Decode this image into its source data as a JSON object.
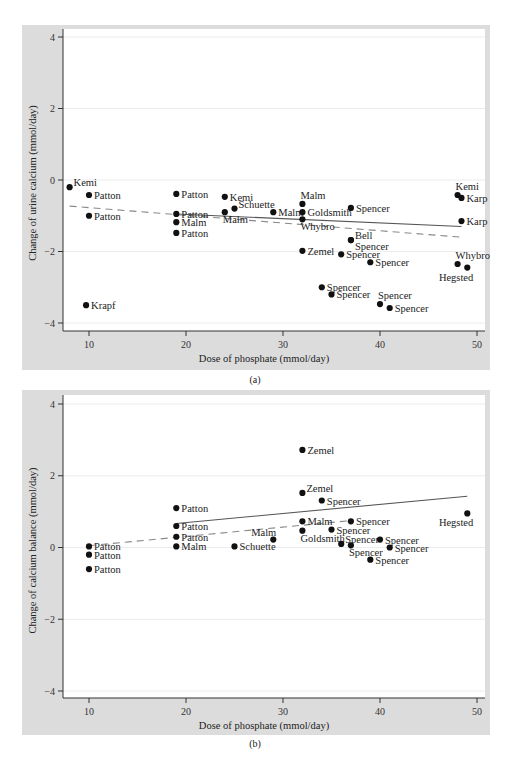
{
  "chart_data": [
    {
      "id": "a",
      "type": "scatter",
      "caption": "(a)",
      "title": "",
      "xlabel": "Dose of phosphate (mmol/day)",
      "ylabel": "Change of urine calcium (mmol/day)",
      "xlim": [
        7.5,
        50.8
      ],
      "ylim": [
        -4.3,
        4.3
      ],
      "xticks": [
        10,
        20,
        30,
        40,
        50
      ],
      "yticks": [
        -4,
        -2,
        0,
        2,
        4
      ],
      "grid": true,
      "points": [
        {
          "x": 8,
          "y": -0.2,
          "label": "Kemi",
          "pos": "right-up"
        },
        {
          "x": 10,
          "y": -0.42,
          "label": "Patton",
          "pos": "right"
        },
        {
          "x": 10,
          "y": -1.0,
          "label": "Patton",
          "pos": "right"
        },
        {
          "x": 9.7,
          "y": -3.5,
          "label": "Krapf",
          "pos": "right"
        },
        {
          "x": 19,
          "y": -0.39,
          "label": "Patton",
          "pos": "right"
        },
        {
          "x": 19,
          "y": -0.95,
          "label": "Patton",
          "pos": "right"
        },
        {
          "x": 19,
          "y": -1.18,
          "label": "Malm",
          "pos": "right"
        },
        {
          "x": 19,
          "y": -1.48,
          "label": "Patton",
          "pos": "right"
        },
        {
          "x": 24,
          "y": -0.47,
          "label": "Kemi",
          "pos": "right"
        },
        {
          "x": 24,
          "y": -0.9,
          "label": "Malm",
          "pos": "below"
        },
        {
          "x": 25,
          "y": -0.8,
          "label": "Schuette",
          "pos": "right-up"
        },
        {
          "x": 29,
          "y": -0.9,
          "label": "Malm",
          "pos": "right"
        },
        {
          "x": 32,
          "y": -0.67,
          "label": "Malm",
          "pos": "above"
        },
        {
          "x": 32,
          "y": -0.9,
          "label": "Goldsmith",
          "pos": "right"
        },
        {
          "x": 32,
          "y": -1.1,
          "label": "Whybro",
          "pos": "below"
        },
        {
          "x": 32,
          "y": -1.98,
          "label": "Zemel",
          "pos": "right"
        },
        {
          "x": 37,
          "y": -0.78,
          "label": "Spencer",
          "pos": "right"
        },
        {
          "x": 37,
          "y": -1.68,
          "label": "Bell",
          "pos": "right-up"
        },
        {
          "x": 37,
          "y": -1.68,
          "label": "Spencer",
          "pos": "right-down"
        },
        {
          "x": 36,
          "y": -2.08,
          "label": "Spencer",
          "pos": "right"
        },
        {
          "x": 39,
          "y": -2.3,
          "label": "Spencer",
          "pos": "right"
        },
        {
          "x": 34,
          "y": -3.0,
          "label": "Spencer",
          "pos": "right"
        },
        {
          "x": 35,
          "y": -3.2,
          "label": "Spencer",
          "pos": "right"
        },
        {
          "x": 40,
          "y": -3.47,
          "label": "Spencer",
          "pos": "above"
        },
        {
          "x": 41,
          "y": -3.58,
          "label": "Spencer",
          "pos": "right"
        },
        {
          "x": 48,
          "y": -0.42,
          "label": "Kemi",
          "pos": "above"
        },
        {
          "x": 48.4,
          "y": -0.5,
          "label": "Karp",
          "pos": "right"
        },
        {
          "x": 48.4,
          "y": -1.15,
          "label": "Karp",
          "pos": "right"
        },
        {
          "x": 48,
          "y": -2.35,
          "label": "Whybro",
          "pos": "above"
        },
        {
          "x": 49,
          "y": -2.45,
          "label": "Hegsted",
          "pos": "below-left"
        }
      ],
      "fit_lines": [
        {
          "style": "solid",
          "x": [
            19,
            48.4
          ],
          "y": [
            -0.95,
            -1.3
          ]
        },
        {
          "style": "dashed",
          "x": [
            8,
            48.4
          ],
          "y": [
            -0.73,
            -1.6
          ]
        }
      ]
    },
    {
      "id": "b",
      "type": "scatter",
      "caption": "(b)",
      "title": "",
      "xlabel": "Dose of phosphate (mmol/day)",
      "ylabel": "Change of calcium balance (mmol/day)",
      "xlim": [
        7.5,
        50.8
      ],
      "ylim": [
        -4.3,
        4.3
      ],
      "xticks": [
        10,
        20,
        30,
        40,
        50
      ],
      "yticks": [
        -4,
        -2,
        0,
        2,
        4
      ],
      "grid": true,
      "points": [
        {
          "x": 10,
          "y": 0.03,
          "label": "Patton",
          "pos": "right"
        },
        {
          "x": 10,
          "y": -0.2,
          "label": "Patton",
          "pos": "right"
        },
        {
          "x": 10,
          "y": -0.6,
          "label": "Patton",
          "pos": "right"
        },
        {
          "x": 19,
          "y": 1.1,
          "label": "Patton",
          "pos": "right"
        },
        {
          "x": 19,
          "y": 0.6,
          "label": "Patton",
          "pos": "right"
        },
        {
          "x": 19,
          "y": 0.3,
          "label": "Patton",
          "pos": "right"
        },
        {
          "x": 19,
          "y": 0.03,
          "label": "Malm",
          "pos": "right"
        },
        {
          "x": 25,
          "y": 0.03,
          "label": "Schuette",
          "pos": "right"
        },
        {
          "x": 29,
          "y": 0.22,
          "label": "Malm",
          "pos": "above-left"
        },
        {
          "x": 32,
          "y": 2.72,
          "label": "Zemel",
          "pos": "right"
        },
        {
          "x": 32,
          "y": 1.52,
          "label": "Zemel",
          "pos": "right-up"
        },
        {
          "x": 34,
          "y": 1.31,
          "label": "Spencer",
          "pos": "right"
        },
        {
          "x": 32,
          "y": 0.73,
          "label": "Malm",
          "pos": "right"
        },
        {
          "x": 32,
          "y": 0.47,
          "label": "Goldsmith",
          "pos": "below"
        },
        {
          "x": 37,
          "y": 0.73,
          "label": "Spencer",
          "pos": "right"
        },
        {
          "x": 35,
          "y": 0.5,
          "label": "Spencer",
          "pos": "right"
        },
        {
          "x": 36,
          "y": 0.1,
          "label": "Spencer",
          "pos": "right-up"
        },
        {
          "x": 37,
          "y": 0.06,
          "label": "Spencer",
          "pos": "below"
        },
        {
          "x": 40,
          "y": 0.22,
          "label": "Spencer",
          "pos": "right"
        },
        {
          "x": 41,
          "y": 0.0,
          "label": "Spencer",
          "pos": "right"
        },
        {
          "x": 39,
          "y": -0.34,
          "label": "Spencer",
          "pos": "right"
        },
        {
          "x": 49,
          "y": 0.95,
          "label": "Hegsted",
          "pos": "below-left"
        }
      ],
      "fit_lines": [
        {
          "style": "solid",
          "x": [
            19,
            49
          ],
          "y": [
            0.67,
            1.43
          ]
        },
        {
          "style": "dashed",
          "x": [
            10,
            37
          ],
          "y": [
            0.05,
            0.75
          ]
        }
      ]
    }
  ]
}
